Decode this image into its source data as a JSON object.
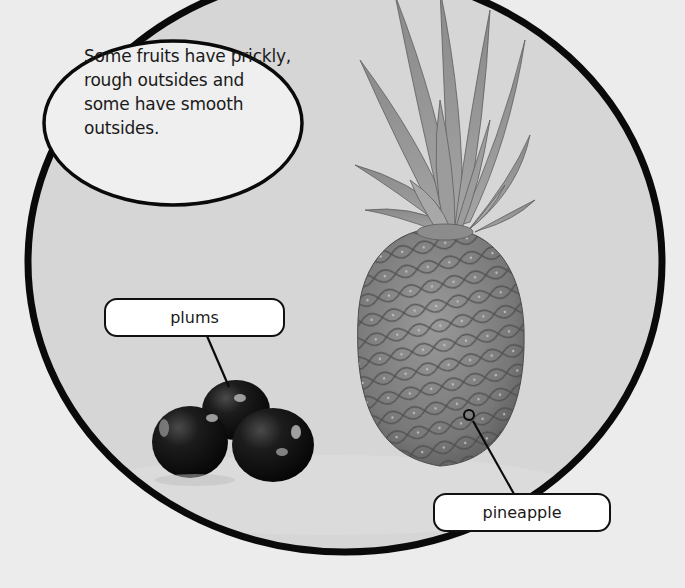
{
  "page": {
    "background_color": "#ececec",
    "frame_interior_color": "#d6d6d6",
    "frame_stroke_color": "#0a0a0a"
  },
  "speech_bubble": {
    "text": "Some fruits have prickly, rough outsides and some have smooth outsides.",
    "lines": [
      "Some fruits have prickly,",
      "rough outsides and",
      "some have smooth",
      "outsides."
    ]
  },
  "labels": [
    {
      "id": "plums",
      "text": "plums",
      "points_to": "plums-image"
    },
    {
      "id": "pineapple",
      "text": "pineapple",
      "points_to": "pineapple-image"
    }
  ],
  "images": [
    {
      "id": "plums-image",
      "description": "three dark glossy plums"
    },
    {
      "id": "pineapple-image",
      "description": "whole pineapple with leafy crown"
    }
  ]
}
